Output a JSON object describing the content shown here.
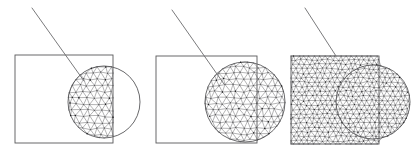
{
  "figure": {
    "width": 418,
    "height": 157,
    "background_color": "#ffffff",
    "outline_color": "#58585a",
    "mesh_color": "#4a4a4c",
    "leader_color": "#6b6b6d",
    "node_color": "#1d1d1f",
    "caption": "",
    "panel_count": 3
  },
  "panels": [
    {
      "id": "panel-1",
      "name": "intersection-mesh-panel",
      "label": "",
      "square": {
        "x": 15,
        "y": 55,
        "width": 98,
        "height": 88
      },
      "circle": {
        "cx": 104,
        "cy": 102,
        "r": 36
      },
      "leader_line": {
        "x1": 32,
        "y1": 8,
        "x2": 84,
        "y2": 81
      },
      "mesh_region": "intersection",
      "mesh_spacing": 7.2,
      "mesh_jitter": 0.16,
      "mesh_seed": 17,
      "show_square_outline": true,
      "show_circle_outline": true
    },
    {
      "id": "panel-2",
      "name": "circle-mesh-panel",
      "label": "",
      "square": {
        "x": 156,
        "y": 56,
        "width": 101,
        "height": 87
      },
      "circle": {
        "cx": 245,
        "cy": 102,
        "r": 40
      },
      "leader_line": {
        "x1": 172,
        "y1": 10,
        "x2": 224,
        "y2": 84
      },
      "mesh_region": "circle",
      "mesh_spacing": 7.0,
      "mesh_jitter": 0.18,
      "mesh_seed": 43,
      "show_square_outline": true,
      "show_circle_outline": true
    },
    {
      "id": "panel-3",
      "name": "union-mesh-panel",
      "label": "",
      "square": {
        "x": 291,
        "y": 56,
        "width": 88,
        "height": 88
      },
      "circle": {
        "cx": 373,
        "cy": 102,
        "r": 37
      },
      "leader_line": {
        "x1": 305,
        "y1": 8,
        "x2": 336,
        "y2": 56
      },
      "mesh_region": "union",
      "mesh_spacing": 5.2,
      "mesh_jitter": 0.2,
      "mesh_seed": 91,
      "show_square_outline": true,
      "show_circle_outline": true
    }
  ]
}
